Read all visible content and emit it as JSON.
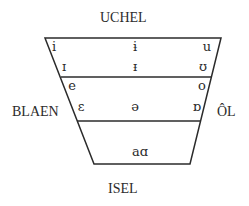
{
  "labels": {
    "top": "UCHEL",
    "bottom": "ISEL",
    "left": "BLAEN",
    "right": "ÔL"
  },
  "vowels": {
    "row1": {
      "front": "i",
      "central": "ɨ",
      "back": "u"
    },
    "row2": {
      "front": "ɪ",
      "central": "ᵻ",
      "back": "ʊ"
    },
    "row3": {
      "front": "e",
      "back": "o"
    },
    "row4": {
      "front": "ɛ",
      "central": "ə",
      "back": "ɒ"
    },
    "row5": {
      "central": "aɑ"
    }
  },
  "colors": {
    "line": "#2b2b2b",
    "text": "#2b2b2b",
    "background": "#ffffff"
  }
}
